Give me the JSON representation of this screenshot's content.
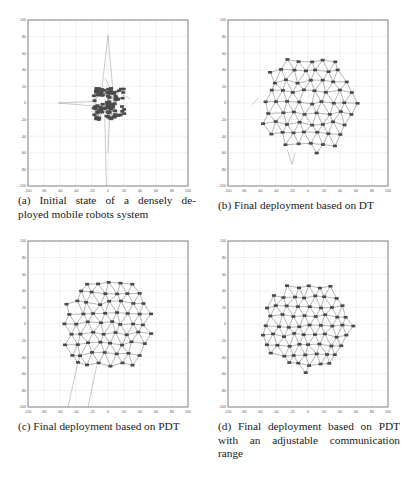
{
  "figure": {
    "panels": [
      {
        "id": "a",
        "caption": "(a) Initial state of a densely deployed mobile robots system",
        "caption_lines": [
          "(a) Initial state of a densely de-",
          "ployed mobile robots system"
        ]
      },
      {
        "id": "b",
        "caption": "(b) Final deployment based on DT",
        "caption_lines": [
          "(b) Final deployment based on DT"
        ]
      },
      {
        "id": "c",
        "caption": "(c) Final deployment based on PDT",
        "caption_lines": [
          "(c) Final deployment based on PDT"
        ]
      },
      {
        "id": "d",
        "caption": "(d) Final deployment based on PDT with an adjustable communication range",
        "caption_lines": [
          "(d) Final deployment based on PDT",
          "with an adjustable communication",
          "range"
        ]
      }
    ]
  },
  "chart_data": [
    {
      "type": "scatter",
      "title": "(a) Initial state of a densely deployed mobile robots system",
      "xlabel": "",
      "ylabel": "",
      "xlim": [
        -100,
        100
      ],
      "ylim": [
        -100,
        100
      ],
      "xticks": [
        -100,
        -80,
        -60,
        -40,
        -20,
        0,
        20,
        40,
        60,
        80,
        100
      ],
      "yticks": [
        -100,
        -80,
        -60,
        -40,
        -20,
        0,
        20,
        40,
        60,
        80,
        100
      ],
      "grid": true,
      "description": "Dense cluster of robots in approx. x∈[-18,22], y∈[-20,18]; a few long links extend to (0,82), (-60,0), (0,-100)",
      "cluster_bounds": {
        "x": [
          -18,
          22
        ],
        "y": [
          -20,
          18
        ]
      },
      "outliers": [
        [
          0,
          82
        ],
        [
          -62,
          0
        ],
        [
          -2,
          -100
        ],
        [
          28,
          5
        ]
      ]
    },
    {
      "type": "scatter",
      "title": "(b) Final deployment based on DT",
      "xlim": [
        -100,
        100
      ],
      "ylim": [
        -100,
        100
      ],
      "xticks": [
        -100,
        -80,
        -60,
        -40,
        -20,
        0,
        20,
        40,
        60,
        80,
        100
      ],
      "yticks": [
        -100,
        -80,
        -60,
        -40,
        -20,
        0,
        20,
        40,
        60,
        80,
        100
      ],
      "grid": true,
      "description": "Robots spread into a roughly circular region of radius ~62 centered near (0,0), connected by Delaunay triangulation edges",
      "approx_extent": {
        "x": [
          -65,
          65
        ],
        "y": [
          -62,
          62
        ]
      }
    },
    {
      "type": "scatter",
      "title": "(c) Final deployment based on PDT",
      "xlim": [
        -100,
        100
      ],
      "ylim": [
        -100,
        100
      ],
      "xticks": [
        -100,
        -80,
        -60,
        -40,
        -20,
        0,
        20,
        40,
        60,
        80,
        100
      ],
      "yticks": [
        -100,
        -80,
        -60,
        -40,
        -20,
        0,
        20,
        40,
        60,
        80,
        100
      ],
      "grid": true,
      "description": "Robots spread into a roughly circular region radius ~62 centered near (0,0) with PDT edges; two stray links extending toward (-50,-100) and (-25,-100)",
      "approx_extent": {
        "x": [
          -62,
          62
        ],
        "y": [
          -62,
          62
        ]
      }
    },
    {
      "type": "scatter",
      "title": "(d) Final deployment based on PDT with an adjustable communication range",
      "xlim": [
        -100,
        100
      ],
      "ylim": [
        -100,
        100
      ],
      "xticks": [
        -100,
        -80,
        -60,
        -40,
        -20,
        0,
        20,
        40,
        60,
        80,
        100
      ],
      "yticks": [
        -100,
        -80,
        -60,
        -40,
        -20,
        0,
        20,
        40,
        60,
        80,
        100
      ],
      "grid": true,
      "description": "Robots spread into a roughly circular region radius ~58 centered near (0,0), denser triangulation, no stray links",
      "approx_extent": {
        "x": [
          -60,
          60
        ],
        "y": [
          -62,
          60
        ]
      }
    }
  ]
}
